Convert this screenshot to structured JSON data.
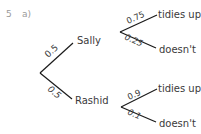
{
  "question": {
    "number": "5",
    "part": "a)"
  },
  "tree": {
    "first_stage": [
      {
        "name": "Sally",
        "probability": "0.5"
      },
      {
        "name": "Rashid",
        "probability": "0.5"
      }
    ],
    "second_stage": {
      "sally": [
        {
          "outcome": "tidies up",
          "probability": "0.75"
        },
        {
          "outcome": "doesn't",
          "probability": "0.25"
        }
      ],
      "rashid": [
        {
          "outcome": "tidies up",
          "probability": "0.9"
        },
        {
          "outcome": "doesn't",
          "probability": "0.1"
        }
      ]
    }
  },
  "colors": {
    "line": "#1a1a1a",
    "text": "#3a3a3a",
    "question_number": "#9a9a9a"
  }
}
